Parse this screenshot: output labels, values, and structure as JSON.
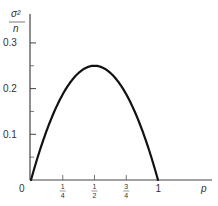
{
  "chart_data": {
    "type": "line",
    "title": "",
    "xlabel": "p",
    "ylabel": "σ²/n",
    "ylabel_parts": {
      "numerator": "σ²",
      "denominator": "n"
    },
    "xlim": [
      0,
      1.15
    ],
    "ylim": [
      0,
      0.3
    ],
    "x_ticks": [
      {
        "value": 0.25,
        "num": "1",
        "den": "4"
      },
      {
        "value": 0.5,
        "num": "1",
        "den": "2"
      },
      {
        "value": 0.75,
        "num": "3",
        "den": "4"
      },
      {
        "value": 1,
        "label": "1"
      }
    ],
    "origin_label": "0",
    "y_ticks": [
      {
        "value": 0.1,
        "label": "0.1"
      },
      {
        "value": 0.2,
        "label": "0.2"
      },
      {
        "value": 0.3,
        "label": "0.3"
      }
    ],
    "y_minor_ticks": [
      0.05,
      0.15,
      0.25
    ],
    "grid": false,
    "legend": null,
    "series": [
      {
        "name": "p(1-p)",
        "x": [
          0,
          0.05,
          0.1,
          0.15,
          0.2,
          0.25,
          0.3,
          0.35,
          0.4,
          0.45,
          0.5,
          0.55,
          0.6,
          0.65,
          0.7,
          0.75,
          0.8,
          0.85,
          0.9,
          0.95,
          1.0
        ],
        "values": [
          0,
          0.0475,
          0.09,
          0.1275,
          0.16,
          0.1875,
          0.21,
          0.2275,
          0.24,
          0.2475,
          0.25,
          0.2475,
          0.24,
          0.2275,
          0.21,
          0.1875,
          0.16,
          0.1275,
          0.09,
          0.0475,
          0
        ]
      }
    ]
  }
}
